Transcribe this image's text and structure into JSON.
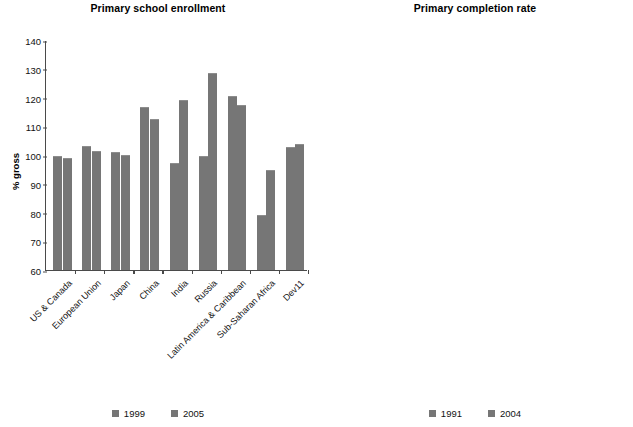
{
  "chart_data": [
    {
      "type": "bar",
      "title": "Primary school enrollment",
      "xlabel": "",
      "ylabel": "% gross",
      "ylim": [
        60,
        140
      ],
      "yticks": [
        60,
        70,
        80,
        90,
        100,
        110,
        120,
        130,
        140
      ],
      "grid": false,
      "legend_position": "bottom-center",
      "categories": [
        "US & Canada",
        "European Union",
        "Japan",
        "China",
        "India",
        "Russia",
        "Latin America & Caribbean",
        "Sub-Saharan Africa",
        "Dev11"
      ],
      "series": [
        {
          "name": "1999",
          "values": [
            99.8,
            103.2,
            101.1,
            116.8,
            97.2,
            99.6,
            120.5,
            79.0,
            102.8
          ]
        },
        {
          "name": "2005",
          "values": [
            98.9,
            101.5,
            100.0,
            112.6,
            119.0,
            128.4,
            117.5,
            94.8,
            103.9
          ]
        }
      ]
    },
    {
      "type": "bar",
      "title": "Primary completion rate",
      "xlabel": "",
      "ylabel": "% of relevant age group",
      "ylim": [
        40,
        100
      ],
      "yticks": [
        40,
        50,
        60,
        70,
        80,
        90,
        100
      ],
      "grid": false,
      "legend_position": "bottom-center",
      "categories": [
        "US & Canada",
        "European Union",
        "Japan",
        "China",
        "India",
        "Russia",
        "Latin America & Caribbean",
        "Sub-Saharan Africa",
        "Dev11"
      ],
      "series": [
        {
          "name": "1991",
          "values": [
            99.4,
            95.2,
            100.6,
            102.4,
            67.8,
            91.5,
            81.2,
            49.3,
            87.8
          ]
        },
        {
          "name": "2004",
          "values": [
            99.4,
            98.2,
            99.4,
            96.9,
            88.0,
            93.0,
            96.2,
            57.6,
            91.6
          ]
        }
      ]
    }
  ],
  "left_chart": {
    "title": "Primary school enrollment",
    "ylabel": "% gross",
    "yticks": [
      "140",
      "130",
      "120",
      "110",
      "100",
      "90",
      "80",
      "70",
      "60"
    ],
    "categories": [
      "US & Canada",
      "European Union",
      "Japan",
      "China",
      "India",
      "Russia",
      "Latin America & Caribbean",
      "Sub-Saharan Africa",
      "Dev11"
    ],
    "legend": [
      "1999",
      "2005"
    ]
  },
  "right_chart": {
    "title": "Primary completion rate",
    "ylabel": "% of relevant age group",
    "yticks": [
      "100",
      "90",
      "80",
      "70",
      "60",
      "50",
      "40"
    ],
    "categories": [
      "US & Canada",
      "European Union",
      "Japan",
      "China",
      "India",
      "Russia",
      "Latin America & Caribbean",
      "Sub-Saharan Africa",
      "Dev11"
    ],
    "legend": [
      "1991",
      "2004"
    ]
  },
  "colors": {
    "bar": "#767676",
    "axis": "#4a4a4a",
    "text": "#111111",
    "background": "#ffffff"
  }
}
